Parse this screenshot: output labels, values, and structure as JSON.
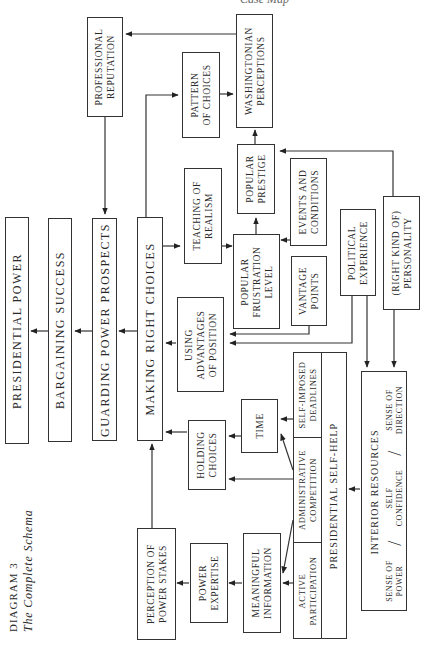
{
  "header": {
    "running_head": "Case Map"
  },
  "caption": {
    "label": "DIAGRAM 3",
    "title": "The Complete Schema"
  },
  "nodes": {
    "presidential_power": "PRESIDENTIAL POWER",
    "bargaining_success": "BARGAINING SUCCESS",
    "guarding_power_prospects": "GUARDING POWER PROSPECTS",
    "making_right_choices": "MAKING RIGHT CHOICES",
    "professional_reputation": [
      "PROFESSIONAL",
      "REPUTATION"
    ],
    "pattern_of_choices": [
      "PATTERN",
      "OF CHOICES"
    ],
    "washingtonian_perceptions": [
      "WASHINGTONIAN",
      "PERCEPTIONS"
    ],
    "popular_prestige": [
      "POPULAR",
      "PRESTIGE"
    ],
    "teaching_of_realism": [
      "TEACHING OF",
      "REALISM"
    ],
    "events_and_conditions": [
      "EVENTS AND",
      "CONDITIONS"
    ],
    "popular_frustration_level": [
      "POPULAR",
      "FRUSTRATION",
      "LEVEL"
    ],
    "vantage_points": [
      "VANTAGE",
      "POINTS"
    ],
    "political_experience": [
      "POLITICAL",
      "EXPERIENCE"
    ],
    "right_kind_of_personality": [
      "(RIGHT KIND OF)",
      "PERSONALITY"
    ],
    "using_advantages_of_position": [
      "USING",
      "ADVANTAGES",
      "OF POSITION"
    ],
    "holding_choices": [
      "HOLDING",
      "CHOICES"
    ],
    "time": "TIME",
    "self_imposed_deadlines": [
      "SELF-IMPOSED",
      "DEADLINES"
    ],
    "administrative_competition": [
      "ADMINISTRATIVE",
      "COMPETITION"
    ],
    "active_participation": [
      "ACTIVE",
      "PARTICIPATION"
    ],
    "presidential_self_help": "PRESIDENTIAL SELF-HELP",
    "perception_of_power_stakes": [
      "PERCEPTION OF",
      "POWER STAKES"
    ],
    "power_expertise": [
      "POWER",
      "EXPERTISE"
    ],
    "meaningful_information": [
      "MEANINGFUL",
      "INFORMATION"
    ],
    "interior_resources": {
      "title": "INTERIOR RESOURCES",
      "sense_of_power": [
        "SENSE OF",
        "POWER"
      ],
      "self_confidence": [
        "SELF",
        "CONFIDENCE"
      ],
      "sense_of_direction": [
        "SENSE OF",
        "DIRECTION"
      ],
      "separator": "/"
    }
  }
}
